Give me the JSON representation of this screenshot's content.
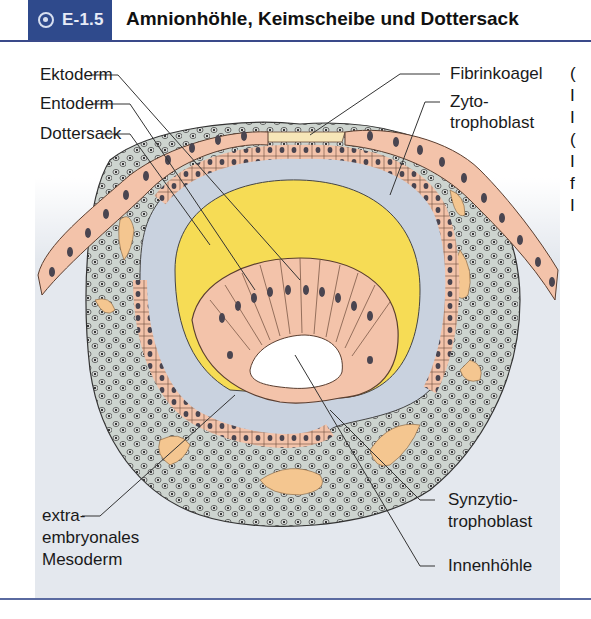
{
  "figure": {
    "badge_number": "E-1.5",
    "badge_icon": "target-icon",
    "title": "Amnionhöhle, Keimscheibe und Dottersack",
    "colors": {
      "badge_bg": "#2f4a8c",
      "rule": "#3a4a8a",
      "panel_bg": "#e4e8ee",
      "trophoblast_cells": "#f3c3aa",
      "yolk": "#f6dc55",
      "mesoderm": "#cdd4cf",
      "fibrin": "#f7e6b8",
      "lacunae": "#f4c690"
    }
  },
  "labels": {
    "left": [
      {
        "text": "Ektoderm"
      },
      {
        "text": "Entoderm"
      },
      {
        "text": "Dottersack"
      }
    ],
    "right": [
      {
        "text": "Fibrinkoagel"
      },
      {
        "text": "Zyto-"
      },
      {
        "text": "trophoblast"
      }
    ],
    "bottom_left": [
      "extra-",
      "embryonales",
      "Mesoderm"
    ],
    "bottom_right": [
      {
        "text": "Synzytio-"
      },
      {
        "text": "trophoblast"
      },
      {
        "text": "Innenhöhle"
      }
    ]
  },
  "side_text_fragments": [
    "(",
    "I",
    "I",
    "(",
    "I",
    "f",
    "I"
  ]
}
